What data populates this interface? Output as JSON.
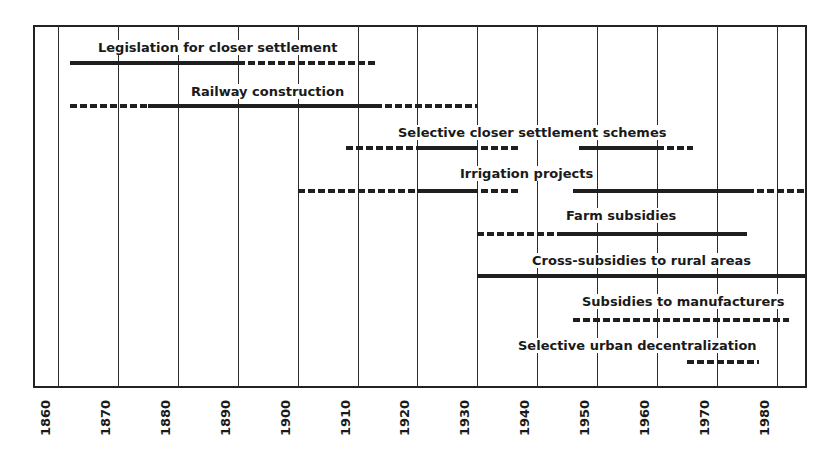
{
  "chart_data": {
    "type": "timeline",
    "title": "",
    "xlabel": "",
    "ylabel": "",
    "x_ticks": [
      1860,
      1870,
      1880,
      1890,
      1900,
      1910,
      1920,
      1930,
      1940,
      1950,
      1960,
      1970,
      1980
    ],
    "xlim": [
      1856,
      1985
    ],
    "grid": true,
    "legend": {
      "solid": "major activity",
      "dashed": "minor activity"
    },
    "rows": [
      {
        "label": "Legislation for closer settlement",
        "segments": [
          {
            "start": 1862,
            "end": 1890,
            "style": "solid"
          },
          {
            "start": 1890,
            "end": 1913,
            "style": "dashed"
          }
        ]
      },
      {
        "label": "Railway construction",
        "segments": [
          {
            "start": 1862,
            "end": 1875,
            "style": "dashed"
          },
          {
            "start": 1875,
            "end": 1913,
            "style": "solid"
          },
          {
            "start": 1913,
            "end": 1930,
            "style": "dashed"
          }
        ]
      },
      {
        "label": "Selective closer settlement schemes",
        "segments": [
          {
            "start": 1908,
            "end": 1920,
            "style": "dashed"
          },
          {
            "start": 1920,
            "end": 1929,
            "style": "solid"
          },
          {
            "start": 1929,
            "end": 1937,
            "style": "dashed"
          },
          {
            "start": 1947,
            "end": 1960,
            "style": "solid"
          },
          {
            "start": 1960,
            "end": 1966,
            "style": "dashed"
          }
        ]
      },
      {
        "label": "Irrigation projects",
        "segments": [
          {
            "start": 1900,
            "end": 1920,
            "style": "dashed"
          },
          {
            "start": 1920,
            "end": 1929,
            "style": "solid"
          },
          {
            "start": 1929,
            "end": 1937,
            "style": "dashed"
          },
          {
            "start": 1946,
            "end": 1975,
            "style": "solid"
          },
          {
            "start": 1975,
            "end": 1985,
            "style": "dashed"
          }
        ]
      },
      {
        "label": "Farm subsidies",
        "segments": [
          {
            "start": 1930,
            "end": 1944,
            "style": "dashed"
          },
          {
            "start": 1944,
            "end": 1975,
            "style": "solid"
          }
        ]
      },
      {
        "label": "Cross-subsidies to rural areas",
        "segments": [
          {
            "start": 1930,
            "end": 1985,
            "style": "solid"
          }
        ]
      },
      {
        "label": "Subsidies to manufacturers",
        "segments": [
          {
            "start": 1946,
            "end": 1982,
            "style": "dashed"
          }
        ]
      },
      {
        "label": "Selective urban decentralization",
        "segments": [
          {
            "start": 1965,
            "end": 1977,
            "style": "dashed"
          }
        ]
      }
    ]
  },
  "layout_rows": [
    {
      "label_x": 95,
      "label_y": 40,
      "bar_y": 63
    },
    {
      "label_x": 188,
      "label_y": 84,
      "bar_y": 106
    },
    {
      "label_x": 395,
      "label_y": 125,
      "bar_y": 148
    },
    {
      "label_x": 457,
      "label_y": 166,
      "bar_y": 191
    },
    {
      "label_x": 563,
      "label_y": 208,
      "bar_y": 234
    },
    {
      "label_x": 529,
      "label_y": 253,
      "bar_y": 276
    },
    {
      "label_x": 579,
      "label_y": 294,
      "bar_y": 320
    },
    {
      "label_x": 515,
      "label_y": 338,
      "bar_y": 362
    }
  ]
}
